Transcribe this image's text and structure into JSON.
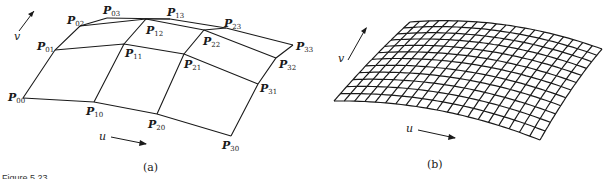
{
  "figure": {
    "caption": "Figure 5.23",
    "panel_a": {
      "label": "(a)",
      "u_label": "u",
      "v_label": "v",
      "control_points": [
        {
          "name": "P",
          "sub": "00",
          "x": 23,
          "y": 98,
          "lx": 8,
          "ly": 101
        },
        {
          "name": "P",
          "sub": "10",
          "x": 94,
          "y": 102,
          "lx": 86,
          "ly": 115
        },
        {
          "name": "P",
          "sub": "20",
          "x": 157,
          "y": 114,
          "lx": 148,
          "ly": 128
        },
        {
          "name": "P",
          "sub": "30",
          "x": 231,
          "y": 136,
          "lx": 222,
          "ly": 149
        },
        {
          "name": "P",
          "sub": "01",
          "x": 55,
          "y": 50,
          "lx": 37,
          "ly": 50
        },
        {
          "name": "P",
          "sub": "11",
          "x": 124,
          "y": 44,
          "lx": 125,
          "ly": 57
        },
        {
          "name": "P",
          "sub": "21",
          "x": 184,
          "y": 54,
          "lx": 184,
          "ly": 68
        },
        {
          "name": "P",
          "sub": "31",
          "x": 258,
          "y": 84,
          "lx": 260,
          "ly": 92
        },
        {
          "name": "P",
          "sub": "02",
          "x": 80,
          "y": 26,
          "lx": 67,
          "ly": 24
        },
        {
          "name": "P",
          "sub": "12",
          "x": 146,
          "y": 19,
          "lx": 146,
          "ly": 34
        },
        {
          "name": "P",
          "sub": "22",
          "x": 204,
          "y": 30,
          "lx": 203,
          "ly": 45
        },
        {
          "name": "P",
          "sub": "32",
          "x": 276,
          "y": 58,
          "lx": 279,
          "ly": 68
        },
        {
          "name": "P",
          "sub": "03",
          "x": 107,
          "y": 18,
          "lx": 103,
          "ly": 14
        },
        {
          "name": "P",
          "sub": "13",
          "x": 170,
          "y": 19,
          "lx": 167,
          "ly": 16
        },
        {
          "name": "P",
          "sub": "23",
          "x": 226,
          "y": 28,
          "lx": 224,
          "ly": 27
        },
        {
          "name": "P",
          "sub": "33",
          "x": 293,
          "y": 45,
          "lx": 296,
          "ly": 50
        }
      ]
    },
    "panel_b": {
      "label": "(b)",
      "u_label": "u",
      "v_label": "v",
      "grid_columns": 20,
      "grid_rows": 12,
      "corners": {
        "bottom_left": [
          334,
          101
        ],
        "top_left": [
          410,
          22
        ],
        "top_right": [
          602,
          49
        ],
        "bottom_right": [
          540,
          140
        ]
      }
    }
  }
}
